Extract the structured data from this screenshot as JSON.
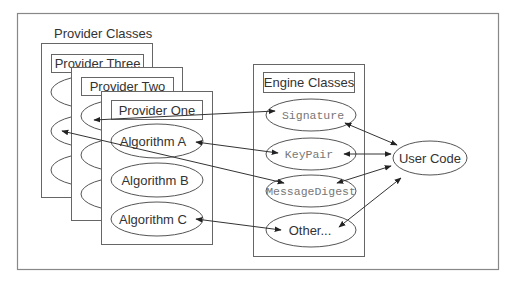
{
  "colors": {
    "stroke": "#555555",
    "frame": "#777777",
    "text": "#222222",
    "mono_text": "#777777",
    "fill": "#ffffff"
  },
  "diagram": {
    "section_label": "Provider Classes",
    "providers": [
      {
        "name": "Provider Three",
        "algorithms": [
          "",
          "",
          ""
        ]
      },
      {
        "name": "Provider Two",
        "algorithms": [
          "",
          "",
          ""
        ]
      },
      {
        "name": "Provider One",
        "algorithms": [
          "Algorithm A",
          "Algorithm B",
          "Algorithm C"
        ]
      }
    ],
    "engine": {
      "title": "Engine Classes",
      "classes": [
        "Signature",
        "KeyPair",
        "MessageDigest",
        "Other..."
      ]
    },
    "user_code": "User Code",
    "connections": [
      {
        "from": "Provider Two algorithm 1",
        "to": "Signature",
        "direction": "both"
      },
      {
        "from": "Algorithm A",
        "to": "KeyPair",
        "direction": "both"
      },
      {
        "from": "Provider Three algorithm 2",
        "to": "MessageDigest",
        "direction": "both"
      },
      {
        "from": "Algorithm C",
        "to": "Other...",
        "direction": "both"
      },
      {
        "from": "Signature",
        "to": "User Code",
        "direction": "both"
      },
      {
        "from": "KeyPair",
        "to": "User Code",
        "direction": "both"
      },
      {
        "from": "MessageDigest",
        "to": "User Code",
        "direction": "both"
      },
      {
        "from": "Other...",
        "to": "User Code",
        "direction": "both"
      }
    ]
  }
}
